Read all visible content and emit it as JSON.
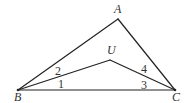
{
  "diagram": {
    "type": "geometry-triangle",
    "vertices": {
      "A": {
        "label": "A",
        "x": 118,
        "y": 19,
        "label_x": 114,
        "label_y": 13
      },
      "B": {
        "label": "B",
        "x": 18,
        "y": 90,
        "label_x": 14,
        "label_y": 101
      },
      "C": {
        "label": "C",
        "x": 175,
        "y": 90,
        "label_x": 172,
        "label_y": 101
      },
      "U": {
        "label": "U",
        "x": 110,
        "y": 60,
        "label_x": 107,
        "label_y": 54
      }
    },
    "segments": [
      {
        "from": "A",
        "to": "B"
      },
      {
        "from": "A",
        "to": "C"
      },
      {
        "from": "B",
        "to": "C"
      },
      {
        "from": "B",
        "to": "U"
      },
      {
        "from": "U",
        "to": "C"
      }
    ],
    "angle_labels": [
      {
        "label": "1",
        "x": 58,
        "y": 88
      },
      {
        "label": "2",
        "x": 55,
        "y": 75
      },
      {
        "label": "3",
        "x": 141,
        "y": 89
      },
      {
        "label": "4",
        "x": 141,
        "y": 73
      }
    ],
    "colors": {
      "line": "#222222",
      "text": "#333333",
      "background": "#ffffff"
    }
  }
}
